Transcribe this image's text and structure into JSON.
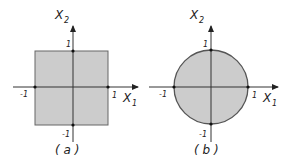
{
  "panels": [
    {
      "id": "a",
      "caption": "( a )",
      "shape": "square",
      "x_axis_label": "X",
      "x_axis_sub": "1",
      "y_axis_label": "X",
      "y_axis_sub": "2",
      "ticks": {
        "pos_x": "1",
        "neg_x": "-1",
        "pos_y": "1",
        "neg_y": "-1"
      }
    },
    {
      "id": "b",
      "caption": "( b )",
      "shape": "circle",
      "x_axis_label": "X",
      "x_axis_sub": "1",
      "y_axis_label": "X",
      "y_axis_sub": "2",
      "ticks": {
        "pos_x": "1",
        "neg_x": "-1",
        "pos_y": "1",
        "neg_y": "-1"
      }
    }
  ],
  "colors": {
    "fill": "#cccccc",
    "stroke": "#555555",
    "axis": "#333333"
  }
}
